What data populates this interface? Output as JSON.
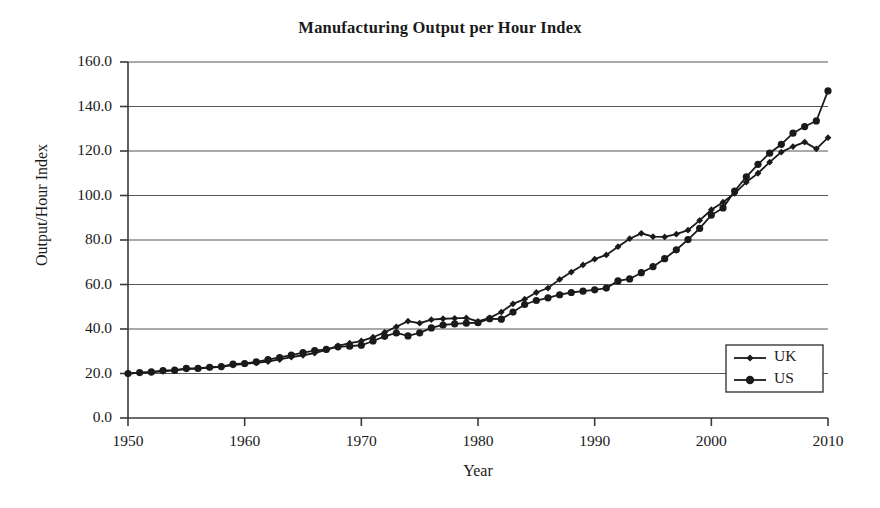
{
  "chart_data": {
    "type": "line",
    "title": "Manufacturing Output per Hour Index",
    "xlabel": "Year",
    "ylabel": "Output/Hour Index",
    "xlim": [
      1950,
      2010
    ],
    "ylim": [
      0.0,
      160.0
    ],
    "grid": "horizontal",
    "legend_position": "bottom-right",
    "xticks": [
      "1950",
      "1960",
      "1970",
      "1980",
      "1990",
      "2000",
      "2010"
    ],
    "xtick_values": [
      1950,
      1960,
      1970,
      1980,
      1990,
      2000,
      2010
    ],
    "yticks": [
      "0.0",
      "20.0",
      "40.0",
      "60.0",
      "80.0",
      "100.0",
      "120.0",
      "140.0",
      "160.0"
    ],
    "ytick_values": [
      0,
      20,
      40,
      60,
      80,
      100,
      120,
      140,
      160
    ],
    "x": [
      1950,
      1951,
      1952,
      1953,
      1954,
      1955,
      1956,
      1957,
      1958,
      1959,
      1960,
      1961,
      1962,
      1963,
      1964,
      1965,
      1966,
      1967,
      1968,
      1969,
      1970,
      1971,
      1972,
      1973,
      1974,
      1975,
      1976,
      1977,
      1978,
      1979,
      1980,
      1981,
      1982,
      1983,
      1984,
      1985,
      1986,
      1987,
      1988,
      1989,
      1990,
      1991,
      1992,
      1993,
      1994,
      1995,
      1996,
      1997,
      1998,
      1999,
      2000,
      2001,
      2002,
      2003,
      2004,
      2005,
      2006,
      2007,
      2008,
      2009,
      2010
    ],
    "series": [
      {
        "name": "UK",
        "marker": "diamond",
        "color": "#1a1a1a",
        "values": [
          20.0,
          20.3,
          20.5,
          21.0,
          21.4,
          22.0,
          22.2,
          22.6,
          23.0,
          23.8,
          24.3,
          24.8,
          25.4,
          26.3,
          27.4,
          28.2,
          29.2,
          30.6,
          32.4,
          33.6,
          34.6,
          36.3,
          38.5,
          41.0,
          43.5,
          42.6,
          44.2,
          44.6,
          44.8,
          45.0,
          43.4,
          45.0,
          47.6,
          51.3,
          53.4,
          56.4,
          58.4,
          62.3,
          65.6,
          68.8,
          71.4,
          73.3,
          77.0,
          80.6,
          83.0,
          81.5,
          81.4,
          82.6,
          84.4,
          88.8,
          93.6,
          97.0,
          101.0,
          106.0,
          110.0,
          115.0,
          119.5,
          122.0,
          124.0,
          121.0,
          126.0
        ]
      },
      {
        "name": "US",
        "marker": "circle",
        "color": "#1a1a1a",
        "values": [
          20.0,
          20.4,
          20.7,
          21.3,
          21.5,
          22.3,
          22.3,
          22.8,
          23.1,
          24.2,
          24.5,
          25.2,
          26.2,
          27.2,
          28.3,
          29.4,
          30.3,
          30.8,
          32.0,
          32.3,
          32.7,
          34.6,
          36.7,
          38.2,
          36.9,
          38.3,
          40.5,
          41.8,
          42.3,
          42.6,
          42.8,
          44.6,
          44.4,
          47.6,
          51.0,
          52.8,
          54.0,
          55.4,
          56.4,
          57.0,
          57.6,
          58.4,
          61.6,
          62.5,
          65.3,
          68.0,
          71.6,
          75.6,
          80.2,
          85.2,
          91.2,
          94.4,
          102.0,
          108.4,
          114.0,
          119.0,
          123.0,
          128.0,
          131.0,
          133.5,
          147.0
        ]
      }
    ]
  },
  "legend": {
    "entries": [
      {
        "label": "UK"
      },
      {
        "label": "US"
      }
    ]
  }
}
